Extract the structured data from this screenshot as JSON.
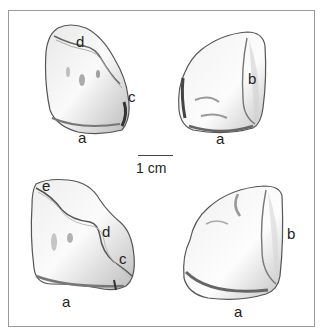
{
  "figure": {
    "scale_bar": {
      "label": "1 cm"
    },
    "specimens": [
      {
        "id": "top-left",
        "labels": [
          "d",
          "c",
          "a"
        ]
      },
      {
        "id": "top-right",
        "labels": [
          "b",
          "a"
        ]
      },
      {
        "id": "bottom-left",
        "labels": [
          "e",
          "d",
          "c",
          "a"
        ]
      },
      {
        "id": "bottom-right",
        "labels": [
          "b",
          "a"
        ]
      }
    ]
  }
}
